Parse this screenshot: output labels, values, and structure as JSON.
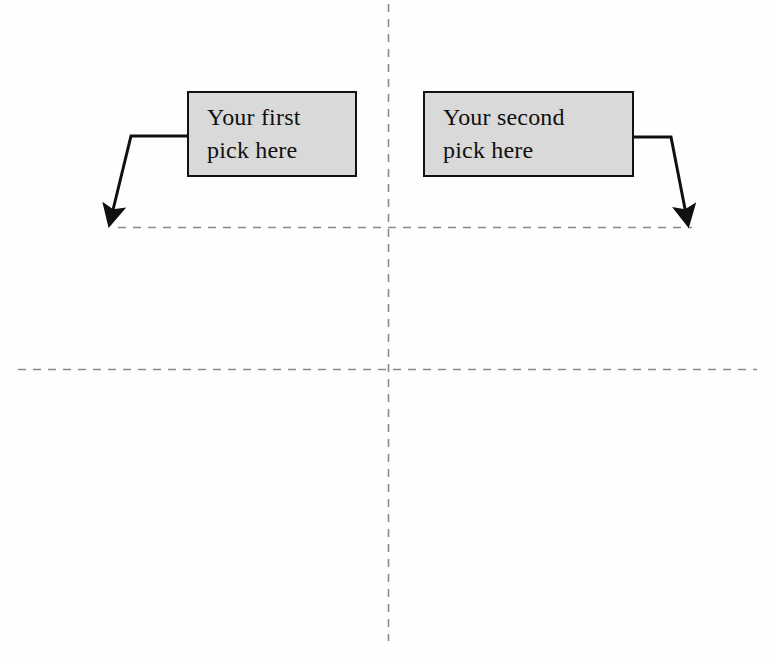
{
  "page": {
    "background_color": "#fefefe",
    "width": 771,
    "height": 664
  },
  "callouts": [
    {
      "id": "first-pick",
      "line1": "Your first",
      "line2": "pick here",
      "fill_color": "#d9d9d9",
      "border_color": "#121212",
      "text_color": "#101010",
      "x": 187,
      "y": 91,
      "width": 170,
      "height": 86
    },
    {
      "id": "second-pick",
      "line1": "Your second",
      "line2": "pick here",
      "fill_color": "#d9d9d9",
      "border_color": "#121212",
      "text_color": "#101010",
      "x": 423,
      "y": 91,
      "width": 211,
      "height": 86
    }
  ],
  "arrows": [
    {
      "id": "arrow-left",
      "description": "elbow arrow from left edge of first box, down-left to upper dashed rule",
      "color": "#101010",
      "stroke_width": 3,
      "points": "187,136 130,136 113,213",
      "tip_x": 112,
      "tip_y": 225
    },
    {
      "id": "arrow-right",
      "description": "elbow arrow from right edge of second box, down-right to upper dashed rule",
      "color": "#101010",
      "stroke_width": 3,
      "points": "634,137 671,137 685,213",
      "tip_x": 686,
      "tip_y": 225
    }
  ],
  "guides": [
    {
      "id": "rule-horizontal-upper",
      "orientation": "horizontal",
      "color": "#8a8a8a",
      "x1": 118,
      "y1": 227,
      "x2": 692,
      "y2": 227,
      "dash": "7 7"
    },
    {
      "id": "rule-horizontal-lower",
      "orientation": "horizontal",
      "color": "#8a8a8a",
      "x1": 18,
      "y1": 369,
      "x2": 757,
      "y2": 369,
      "dash": "7 7"
    },
    {
      "id": "rule-vertical-center",
      "orientation": "vertical",
      "color": "#8a8a8a",
      "x1": 388,
      "y1": 4,
      "x2": 388,
      "y2": 641,
      "dash": "7 7"
    }
  ]
}
